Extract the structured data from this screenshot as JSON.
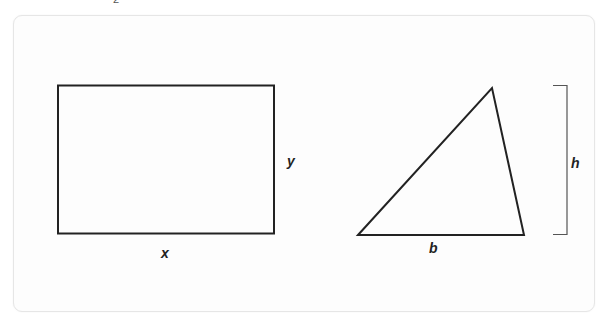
{
  "top_fragment": "2",
  "figures": {
    "rectangle": {
      "shape": "rectangle",
      "width_label": "x",
      "height_label": "y"
    },
    "triangle": {
      "shape": "triangle",
      "base_label": "b",
      "height_label": "h"
    }
  },
  "colors": {
    "stroke": "#222222",
    "card_border": "#e6e6e6",
    "bracket": "#555555"
  }
}
